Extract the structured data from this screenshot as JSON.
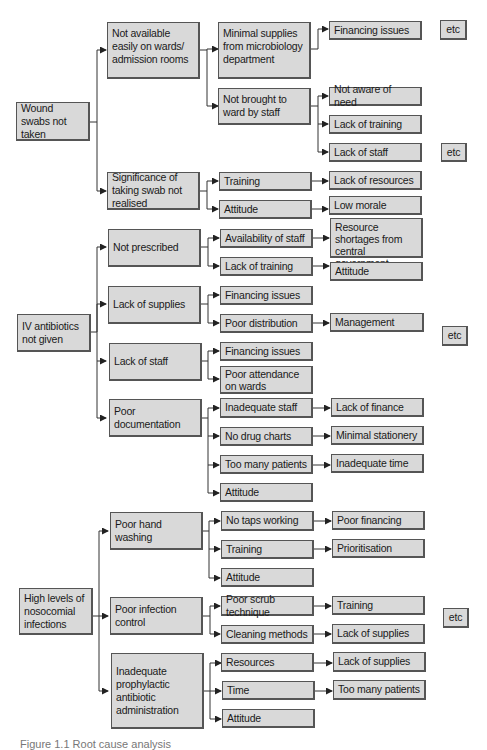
{
  "diagram": {
    "type": "root-cause-tree",
    "roots": [
      {
        "id": "r1",
        "label": "Wound swabs not taken",
        "lines": [
          "Wound",
          "swabs not taken"
        ],
        "children": [
          {
            "id": "r1a",
            "label": "Not available easily on wards/ admission rooms",
            "children": [
              {
                "id": "r1a1",
                "label": "Minimal supplies from microbiology department",
                "children": [
                  {
                    "id": "r1a1x",
                    "label": "Financing issues"
                  }
                ]
              },
              {
                "id": "r1a2",
                "label": "Not brought to ward by staff",
                "children": [
                  {
                    "id": "r1a2x",
                    "label": "Not aware of need"
                  },
                  {
                    "id": "r1a2y",
                    "label": "Lack of training"
                  },
                  {
                    "id": "r1a2z",
                    "label": "Lack of staff"
                  }
                ]
              }
            ]
          },
          {
            "id": "r1b",
            "label": "Significance of taking swab not realised",
            "children": [
              {
                "id": "r1b1",
                "label": "Training",
                "children": [
                  {
                    "id": "r1b1x",
                    "label": "Lack of resources"
                  }
                ]
              },
              {
                "id": "r1b2",
                "label": "Attitude",
                "children": [
                  {
                    "id": "r1b2x",
                    "label": "Low morale"
                  }
                ]
              }
            ]
          }
        ]
      },
      {
        "id": "r2",
        "label": "IV antibiotics not given",
        "children": [
          {
            "id": "r2a",
            "label": "Not prescribed",
            "children": [
              {
                "id": "r2a1",
                "label": "Availability of staff",
                "children": [
                  {
                    "id": "r2a1x",
                    "label": "Resource shortages from central government"
                  }
                ]
              },
              {
                "id": "r2a2",
                "label": "Lack of training",
                "children": [
                  {
                    "id": "r2a2x",
                    "label": "Attitude"
                  }
                ]
              }
            ]
          },
          {
            "id": "r2b",
            "label": "Lack of supplies",
            "children": [
              {
                "id": "r2b1",
                "label": "Financing issues"
              },
              {
                "id": "r2b2",
                "label": "Poor distribution",
                "children": [
                  {
                    "id": "r2b2x",
                    "label": "Management"
                  }
                ]
              }
            ]
          },
          {
            "id": "r2c",
            "label": "Lack of staff",
            "children": [
              {
                "id": "r2c1",
                "label": "Financing issues"
              },
              {
                "id": "r2c2",
                "label": "Poor attendance on wards"
              }
            ]
          },
          {
            "id": "r2d",
            "label": "Poor documentation",
            "children": [
              {
                "id": "r2d1",
                "label": "Inadequate staff",
                "children": [
                  {
                    "id": "r2d1x",
                    "label": "Lack of finance"
                  }
                ]
              },
              {
                "id": "r2d2",
                "label": "No drug charts",
                "children": [
                  {
                    "id": "r2d2x",
                    "label": "Minimal stationery"
                  }
                ]
              },
              {
                "id": "r2d3",
                "label": "Too many patients",
                "children": [
                  {
                    "id": "r2d3x",
                    "label": "Inadequate time"
                  }
                ]
              },
              {
                "id": "r2d4",
                "label": "Attitude"
              }
            ]
          }
        ]
      },
      {
        "id": "r3",
        "label": "High levels of nosocomial infections",
        "children": [
          {
            "id": "r3a",
            "label": "Poor hand washing",
            "children": [
              {
                "id": "r3a1",
                "label": "No taps working",
                "children": [
                  {
                    "id": "r3a1x",
                    "label": "Poor financing"
                  }
                ]
              },
              {
                "id": "r3a2",
                "label": "Training",
                "children": [
                  {
                    "id": "r3a2x",
                    "label": "Prioritisation"
                  }
                ]
              },
              {
                "id": "r3a3",
                "label": "Attitude"
              }
            ]
          },
          {
            "id": "r3b",
            "label": "Poor infection control",
            "children": [
              {
                "id": "r3b1",
                "label": "Poor scrub technique",
                "children": [
                  {
                    "id": "r3b1x",
                    "label": "Training"
                  }
                ]
              },
              {
                "id": "r3b2",
                "label": "Cleaning methods",
                "children": [
                  {
                    "id": "r3b2x",
                    "label": "Lack of supplies"
                  }
                ]
              }
            ]
          },
          {
            "id": "r3c",
            "label": "Inadequate prophylactic antibiotic administration",
            "children": [
              {
                "id": "r3c1",
                "label": "Resources",
                "children": [
                  {
                    "id": "r3c1x",
                    "label": "Lack of supplies"
                  }
                ]
              },
              {
                "id": "r3c2",
                "label": "Time",
                "children": [
                  {
                    "id": "r3c2x",
                    "label": "Too many patients"
                  }
                ]
              },
              {
                "id": "r3c3",
                "label": "Attitude"
              }
            ]
          }
        ]
      }
    ],
    "etc_label": "etc",
    "caption": "Figure 1.1  Root cause analysis"
  },
  "labels": {
    "r1": "Wound swabs not taken",
    "r1a": "Not available easily on wards/ admission rooms",
    "r1a1": "Minimal supplies from microbiology department",
    "r1a1x": "Financing issues",
    "r1a2": "Not brought to ward by staff",
    "r1a2x": "Not aware of need",
    "r1a2y": "Lack of training",
    "r1a2z": "Lack of staff",
    "r1b": "Significance of taking swab not realised",
    "r1b1": "Training",
    "r1b1x": "Lack of resources",
    "r1b2": "Attitude",
    "r1b2x": "Low morale",
    "r2": "IV antibiotics not given",
    "r2a": "Not prescribed",
    "r2a1": "Availability of staff",
    "r2a1x": "Resource shortages from central government",
    "r2a2": "Lack of training",
    "r2a2x": "Attitude",
    "r2b": "Lack of supplies",
    "r2b1": "Financing issues",
    "r2b2": "Poor distribution",
    "r2b2x": "Management",
    "r2c": "Lack of staff",
    "r2c1": "Financing issues",
    "r2c2": "Poor attendance on wards",
    "r2d": "Poor documentation",
    "r2d1": "Inadequate staff",
    "r2d1x": "Lack of finance",
    "r2d2": "No drug charts",
    "r2d2x": "Minimal stationery",
    "r2d3": "Too many patients",
    "r2d3x": "Inadequate time",
    "r2d4": "Attitude",
    "r3": "High levels of nosocomial infections",
    "r3a": "Poor hand washing",
    "r3a1": "No taps working",
    "r3a1x": "Poor financing",
    "r3a2": "Training",
    "r3a2x": "Prioritisation",
    "r3a3": "Attitude",
    "r3b": "Poor infection control",
    "r3b1": "Poor scrub technique",
    "r3b1x": "Training",
    "r3b2": "Cleaning methods",
    "r3b2x": "Lack of supplies",
    "r3c": "Inadequate prophylactic antibiotic administration",
    "r3c1": "Resources",
    "r3c1x": "Lack of supplies",
    "r3c2": "Time",
    "r3c2x": "Too many patients",
    "r3c3": "Attitude",
    "etc": "etc"
  },
  "colors": {
    "box_fill": "#d9d9d9",
    "box_border": "#555555",
    "line": "#333333",
    "background": "#ffffff"
  }
}
